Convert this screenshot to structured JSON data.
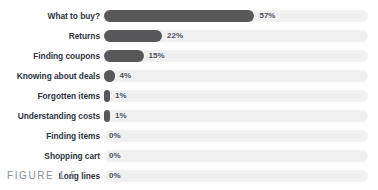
{
  "figure": {
    "caption": "FIGURE 1.5"
  },
  "colors": {
    "bar_fill": "#58585a",
    "bar_track": "#f0f0f0",
    "label_text": "#2f3542",
    "value_text": "#4a5160",
    "caption_text": "#8b8f96",
    "background": "#ffffff"
  },
  "chart_data": {
    "type": "bar",
    "orientation": "horizontal",
    "title": "",
    "subtitle": "",
    "xlabel": "",
    "ylabel": "",
    "xlim": [
      0,
      100
    ],
    "grid": false,
    "legend": false,
    "value_suffix": "%",
    "categories": [
      "What to buy?",
      "Returns",
      "Finding coupons",
      "Knowing about deals",
      "Forgotten items",
      "Understanding costs",
      "Finding items",
      "Shopping cart",
      "Long lines"
    ],
    "values": [
      57,
      22,
      15,
      4,
      1,
      1,
      0,
      0,
      0
    ],
    "value_labels": [
      "57%",
      "22%",
      "15%",
      "4%",
      "1%",
      "1%",
      "0%",
      "0%",
      "0%"
    ]
  }
}
